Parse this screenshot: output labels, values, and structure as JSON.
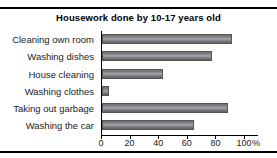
{
  "chart_data": {
    "type": "bar",
    "orientation": "horizontal",
    "title": "Housework done by 10-17 years old",
    "xlabel": "",
    "ylabel": "",
    "unit": "%",
    "xlim": [
      0,
      100
    ],
    "xticks": [
      0,
      20,
      40,
      60,
      80,
      100
    ],
    "xtick_labels": [
      "0",
      "20",
      "40",
      "60",
      "80",
      "100"
    ],
    "grid": false,
    "legend": false,
    "categories": [
      "Cleaning own room",
      "Washing dishes",
      "House cleaning",
      "Washing clothes",
      "Taking out garbage",
      "Washing the car"
    ],
    "values": [
      91,
      77,
      43,
      5,
      88,
      64
    ],
    "bar_color": "#8b8b90",
    "bar_edge_color": "#55555a",
    "axis_color": "#000000",
    "text_color": "#1a1a1a",
    "background_color": "#ffffff"
  }
}
